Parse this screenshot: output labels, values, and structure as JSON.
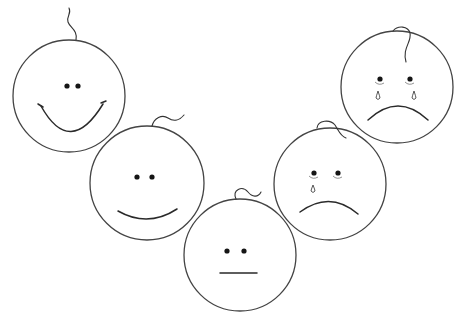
{
  "colors": {
    "background": "#ffffff",
    "stroke": "#444444",
    "eyes": "#151515"
  },
  "faces": [
    {
      "id": "face-very-happy",
      "label": "Very happy",
      "expression": "big smile"
    },
    {
      "id": "face-happy",
      "label": "Happy",
      "expression": "small smile"
    },
    {
      "id": "face-neutral",
      "label": "Neutral",
      "expression": "straight mouth"
    },
    {
      "id": "face-sad",
      "label": "Sad",
      "expression": "frown with one tear"
    },
    {
      "id": "face-very-sad",
      "label": "Very sad",
      "expression": "frown with two tears"
    }
  ]
}
